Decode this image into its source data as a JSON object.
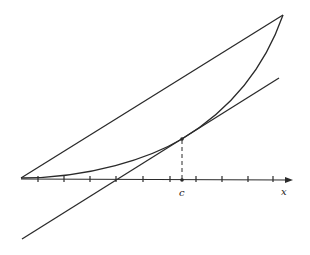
{
  "diagram": {
    "labels": {
      "c": "c",
      "x": "x"
    },
    "colors": {
      "stroke": "#2a2a2a",
      "background": "#ffffff"
    },
    "axis": {
      "origin": [
        21,
        178
      ],
      "end": [
        293,
        180
      ],
      "tick_x": [
        38,
        64,
        90,
        116,
        143,
        170,
        196,
        222,
        248,
        273
      ]
    },
    "points": {
      "start": [
        21,
        178
      ],
      "end": [
        283,
        15
      ],
      "tangent_point": [
        182,
        139
      ],
      "c_on_axis": [
        182,
        180
      ]
    },
    "tangent_line": {
      "from": [
        22,
        239
      ],
      "to": [
        279,
        78
      ]
    }
  }
}
